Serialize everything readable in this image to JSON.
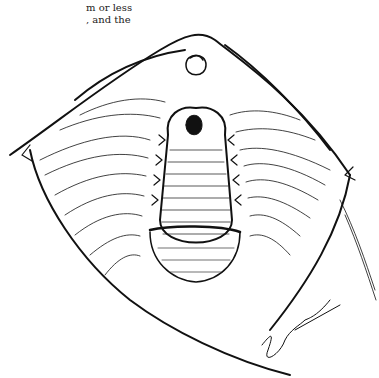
{
  "page": {
    "text_fragment": {
      "line1": "m or less",
      "line2": ", and the"
    },
    "figure": {
      "type": "surgical line illustration",
      "style": "black ink hatching on white",
      "signature": "artist signature (illegible scrawl)",
      "colors": {
        "ink": "#111111",
        "paper": "#ffffff"
      }
    }
  }
}
